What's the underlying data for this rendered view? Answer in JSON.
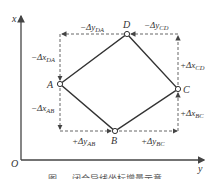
{
  "axes": {
    "x_label": "x",
    "y_label": "y",
    "origin_label": "O"
  },
  "points": [
    {
      "name": "A",
      "cx": 60,
      "cy": 84
    },
    {
      "name": "B",
      "cx": 115,
      "cy": 131
    },
    {
      "name": "C",
      "cx": 178,
      "cy": 89
    },
    {
      "name": "D",
      "cx": 127,
      "cy": 34
    }
  ],
  "labels": {
    "A": "A",
    "B": "B",
    "C": "C",
    "D": "D",
    "dy_DA": "−Δy",
    "dy_DA_sub": "DA",
    "dy_CD": "−Δy",
    "dy_CD_sub": "CD",
    "dx_DA": "−Δx",
    "dx_DA_sub": "DA",
    "dx_CD": "+Δx",
    "dx_CD_sub": "CD",
    "dx_AB": "−Δx",
    "dx_AB_sub": "AB",
    "dx_BC": "+Δx",
    "dx_BC_sub": "BC",
    "dy_AB": "+Δy",
    "dy_AB_sub": "AB",
    "dy_BC": "+Δy",
    "dy_BC_sub": "BC"
  },
  "caption": "图 — 闭合导线坐标增量示意",
  "colors": {
    "line": "#333333",
    "dashed": "#555555",
    "axis": "#444444"
  }
}
